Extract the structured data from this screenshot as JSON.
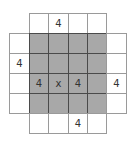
{
  "diagram": {
    "colors": {
      "shaded": "#a8a8a8",
      "unshaded": "#ffffff",
      "text": "#333333"
    },
    "rows": [
      [
        null,
        {
          "fill": "white",
          "text": ""
        },
        {
          "fill": "white",
          "text": "4"
        },
        {
          "fill": "white",
          "text": ""
        },
        {
          "fill": "white",
          "text": ""
        },
        null
      ],
      [
        {
          "fill": "white",
          "text": ""
        },
        {
          "fill": "gray",
          "text": ""
        },
        {
          "fill": "gray",
          "text": ""
        },
        {
          "fill": "gray",
          "text": ""
        },
        {
          "fill": "gray",
          "text": ""
        },
        {
          "fill": "white",
          "text": ""
        }
      ],
      [
        {
          "fill": "white",
          "text": "4"
        },
        {
          "fill": "gray",
          "text": ""
        },
        {
          "fill": "gray",
          "text": ""
        },
        {
          "fill": "gray",
          "text": ""
        },
        {
          "fill": "gray",
          "text": ""
        },
        {
          "fill": "white",
          "text": ""
        }
      ],
      [
        {
          "fill": "white",
          "text": ""
        },
        {
          "fill": "gray",
          "text": "4"
        },
        {
          "fill": "gray",
          "text": "x"
        },
        {
          "fill": "gray",
          "text": "4"
        },
        {
          "fill": "gray",
          "text": ""
        },
        {
          "fill": "white",
          "text": "4"
        }
      ],
      [
        {
          "fill": "white",
          "text": ""
        },
        {
          "fill": "gray",
          "text": ""
        },
        {
          "fill": "gray",
          "text": ""
        },
        {
          "fill": "gray",
          "text": ""
        },
        {
          "fill": "gray",
          "text": ""
        },
        {
          "fill": "white",
          "text": ""
        }
      ],
      [
        null,
        {
          "fill": "white",
          "text": ""
        },
        {
          "fill": "white",
          "text": ""
        },
        {
          "fill": "white",
          "text": "4"
        },
        {
          "fill": "white",
          "text": ""
        },
        null
      ]
    ]
  }
}
